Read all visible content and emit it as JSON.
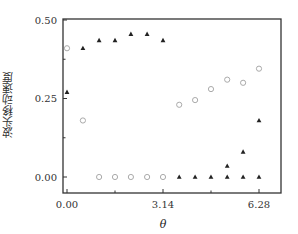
{
  "chart_data": {
    "type": "scatter",
    "title": "",
    "xlabel": "θ",
    "ylabel": "波头移动速度",
    "xlim": [
      0.0,
      6.9
    ],
    "ylim": [
      -0.05,
      0.5
    ],
    "xticks": [
      0.0,
      3.14,
      6.28
    ],
    "xtick_labels": [
      "0.00",
      "3.14",
      "6.28"
    ],
    "yticks": [
      0.0,
      0.25,
      0.5
    ],
    "ytick_labels": [
      "0.00",
      "0.25",
      "0.50"
    ],
    "grid": false,
    "legend": null,
    "series": [
      {
        "name": "triangles",
        "marker": "triangle",
        "color": "#222222",
        "x": [
          0.0,
          0.52,
          1.05,
          1.57,
          2.09,
          2.62,
          3.14,
          3.67,
          4.19,
          4.71,
          5.24,
          5.76,
          6.28,
          5.24,
          5.76,
          6.28
        ],
        "y": [
          0.27,
          0.41,
          0.435,
          0.435,
          0.455,
          0.455,
          0.435,
          0.0,
          0.0,
          0.0,
          0.0,
          0.0,
          0.0,
          0.035,
          0.08,
          0.18
        ]
      },
      {
        "name": "circles",
        "marker": "open-circle",
        "color": "#aaaaaa",
        "x": [
          0.0,
          0.52,
          1.05,
          1.57,
          2.09,
          2.62,
          3.14,
          3.67,
          4.19,
          4.71,
          5.24,
          5.76,
          6.28
        ],
        "y": [
          0.41,
          0.18,
          0.0,
          0.0,
          0.0,
          0.0,
          0.0,
          0.23,
          0.245,
          0.28,
          0.31,
          0.3,
          0.345
        ]
      }
    ]
  },
  "labels": {
    "ylabel": "波头移动速度",
    "xlabel": "θ"
  }
}
